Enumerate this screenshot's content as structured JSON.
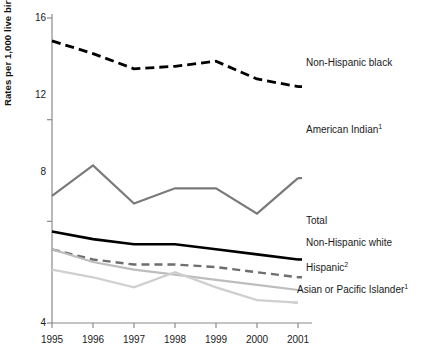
{
  "chart_data": {
    "type": "line",
    "title": "",
    "xlabel": "",
    "ylabel": "Rates per 1,000 live births",
    "categories": [
      "1995",
      "1996",
      "1997",
      "1998",
      "1999",
      "2000",
      "2001"
    ],
    "x": [
      1995,
      1996,
      1997,
      1998,
      1999,
      2000,
      2001
    ],
    "xlim": [
      1995,
      2001
    ],
    "ylim": [
      4,
      16
    ],
    "yticks": [
      4,
      8,
      12,
      16
    ],
    "ytick_labels": [
      "4",
      "8",
      "12",
      "16"
    ],
    "grid": false,
    "legend_position": "right-inline-labels",
    "series": [
      {
        "name": "Non-Hispanic black",
        "label": "Non-Hispanic black",
        "color": "#000000",
        "style": "dashed",
        "width": 2.8,
        "values": [
          15.1,
          14.6,
          14.0,
          14.1,
          14.3,
          13.6,
          13.3
        ],
        "label_x": 306,
        "label_y": 63
      },
      {
        "name": "American Indian",
        "label": "American Indian",
        "superscript": "1",
        "color": "#7a7a7a",
        "style": "solid",
        "width": 2.2,
        "values": [
          9.0,
          10.2,
          8.7,
          9.3,
          9.3,
          8.3,
          9.7
        ],
        "label_x": 306,
        "label_y": 130
      },
      {
        "name": "Total",
        "label": "Total",
        "color": "#000000",
        "style": "solid",
        "width": 2.6,
        "values": [
          7.6,
          7.3,
          7.1,
          7.1,
          6.9,
          6.7,
          6.5
        ],
        "label_x": 306,
        "label_y": 221
      },
      {
        "name": "Non-Hispanic white",
        "label": "Non-Hispanic white",
        "color": "#6e6e6e",
        "style": "dashed",
        "width": 2.4,
        "values": [
          6.9,
          6.5,
          6.3,
          6.3,
          6.2,
          6.0,
          5.8
        ],
        "label_x": 306,
        "label_y": 243
      },
      {
        "name": "Hispanic",
        "label": "Hispanic",
        "superscript": "2",
        "color": "#bdbdbd",
        "style": "solid",
        "width": 2.2,
        "values": [
          6.9,
          6.4,
          6.1,
          5.9,
          5.7,
          5.5,
          5.3
        ],
        "label_x": 306,
        "label_y": 268
      },
      {
        "name": "Asian or Pacific Islander",
        "label": "Asian or Pacific Islander",
        "superscript": "1",
        "color": "#cfcfcf",
        "style": "solid",
        "width": 2.2,
        "values": [
          6.1,
          5.8,
          5.4,
          6.0,
          5.4,
          4.9,
          4.8
        ],
        "label_x": 297,
        "label_y": 290
      }
    ]
  },
  "axis": {
    "y_title": "Rates per 1,000 live births",
    "y_ticks": [
      "16",
      "12",
      "8",
      "4"
    ],
    "x_ticks": [
      "1995",
      "1996",
      "1997",
      "1998",
      "1999",
      "2000",
      "2001"
    ]
  },
  "labels": {
    "non_hispanic_black": "Non-Hispanic black",
    "american_indian": "American Indian",
    "american_indian_sup": "1",
    "total": "Total",
    "non_hispanic_white": "Non-Hispanic white",
    "hispanic": "Hispanic",
    "hispanic_sup": "2",
    "asian_pacific": "Asian or Pacific Islander",
    "asian_pacific_sup": "1"
  },
  "colors": {
    "background": "#ffffff",
    "axis": "#8a8a8a",
    "black_series": "#000000",
    "dark_gray_series": "#6e6e6e",
    "mid_gray_series": "#7a7a7a",
    "light_gray_series": "#bdbdbd",
    "lightest_gray_series": "#cfcfcf",
    "text": "#1a1a1a"
  }
}
